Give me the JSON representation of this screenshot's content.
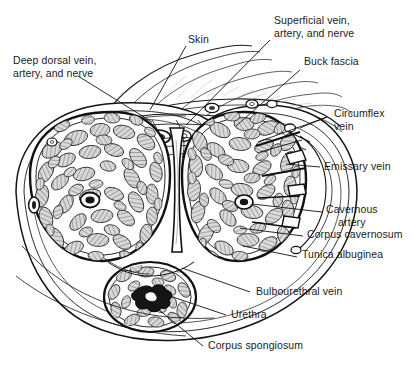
{
  "figure": {
    "kind": "anatomical-cross-section-illustration",
    "width": 418,
    "height": 370,
    "background_color": "#ffffff",
    "ink_color": "#111111",
    "fill_tint": "#b9b9b9"
  },
  "labels": [
    {
      "id": "skin",
      "text": "Skin",
      "x": 188,
      "y": 39,
      "align": "left"
    },
    {
      "id": "superficial-vessels",
      "text": "Superficial vein,\nartery, and nerve",
      "x": 274,
      "y": 20,
      "align": "left"
    },
    {
      "id": "deep-dorsal-vessels",
      "text": "Deep dorsal vein,\nartery, and nerve",
      "x": 13,
      "y": 60,
      "align": "left"
    },
    {
      "id": "buck-fascia",
      "text": "Buck fascia",
      "x": 304,
      "y": 61,
      "align": "left"
    },
    {
      "id": "circumflex-vein",
      "text": "Circumflex\nvein",
      "x": 330,
      "y": 112,
      "align": "left"
    },
    {
      "id": "emissary-vein",
      "text": "Emissary vein",
      "x": 322,
      "y": 163,
      "align": "left"
    },
    {
      "id": "cavernous-artery",
      "text": "Cavernous\nartery",
      "x": 325,
      "y": 207,
      "align": "left"
    },
    {
      "id": "corpus-cavernosum",
      "text": "Corpus cavernosum",
      "x": 307,
      "y": 232,
      "align": "left"
    },
    {
      "id": "tunica-albuginea",
      "text": "Tunica albuginea",
      "x": 300,
      "y": 252,
      "align": "left"
    },
    {
      "id": "bulbourethral-vein",
      "text": "Bulbourethral vein",
      "x": 254,
      "y": 288,
      "align": "left"
    },
    {
      "id": "urethra",
      "text": "Urethra",
      "x": 230,
      "y": 311,
      "align": "left"
    },
    {
      "id": "corpus-spongiosum",
      "text": "Corpus spongiosum",
      "x": 207,
      "y": 342,
      "align": "left"
    }
  ],
  "leader_lines": [
    {
      "id": "skin-leader",
      "from": [
        186,
        46
      ],
      "to": [
        150,
        110
      ]
    },
    {
      "id": "superficial-leader",
      "from": [
        270,
        40
      ],
      "to": [
        186,
        125
      ]
    },
    {
      "id": "deep-dorsal-leader",
      "from": [
        78,
        76
      ],
      "to": [
        152,
        122
      ]
    },
    {
      "id": "buck-fascia-leader",
      "from": [
        300,
        70
      ],
      "to": [
        236,
        126
      ]
    },
    {
      "id": "circumflex-leader-a",
      "from": [
        327,
        117
      ],
      "to": [
        300,
        128
      ]
    },
    {
      "id": "circumflex-leader-b",
      "from": [
        327,
        117
      ],
      "to": [
        258,
        142
      ]
    },
    {
      "id": "emissary-leader",
      "from": [
        320,
        167
      ],
      "to": [
        292,
        165
      ]
    },
    {
      "id": "cavernous-artery-leader",
      "from": [
        322,
        212
      ],
      "to": [
        258,
        204
      ]
    },
    {
      "id": "corpus-cavernosum-leader",
      "from": [
        303,
        236
      ],
      "to": [
        240,
        228
      ]
    },
    {
      "id": "tunica-albuginea-leader",
      "from": [
        297,
        257
      ],
      "to": [
        243,
        246
      ]
    },
    {
      "id": "bulbourethral-leader",
      "from": [
        250,
        292
      ],
      "to": [
        180,
        268
      ]
    },
    {
      "id": "urethra-leader",
      "from": [
        226,
        315
      ],
      "to": [
        152,
        288
      ]
    },
    {
      "id": "corpus-spongiosum-leader",
      "from": [
        203,
        346
      ],
      "to": [
        142,
        296
      ]
    }
  ]
}
